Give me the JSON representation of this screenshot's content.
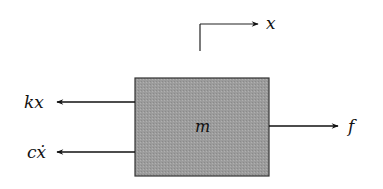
{
  "diagram": {
    "type": "free-body diagram",
    "mass_block": {
      "label": "m",
      "fill": "#9a9a9a"
    },
    "displacement": {
      "label": "x",
      "direction": "right"
    },
    "forces": [
      {
        "label": "kx",
        "direction": "left"
      },
      {
        "label": "cẋ",
        "direction": "left"
      },
      {
        "label": "f",
        "direction": "right"
      }
    ]
  }
}
